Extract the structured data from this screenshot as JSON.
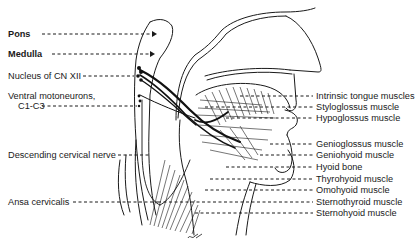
{
  "diagram": {
    "type": "anatomical-illustration",
    "signature": "ck",
    "left_labels": [
      {
        "text": "Pons",
        "bold": true
      },
      {
        "text": "Medulla",
        "bold": true
      },
      {
        "text": "Nucleus of CN XII",
        "bold": false
      },
      {
        "text": "Ventral motoneurons,",
        "bold": false
      },
      {
        "text": "C1-C3",
        "bold": false
      },
      {
        "text": "Descending cervical nerve",
        "bold": false
      },
      {
        "text": "Ansa cervicalis",
        "bold": false
      }
    ],
    "right_labels": [
      {
        "text": "Intrinsic tongue muscles"
      },
      {
        "text": "Styloglossus muscle"
      },
      {
        "text": "Hypoglossus muscle"
      },
      {
        "text": "Genioglossus muscle"
      },
      {
        "text": "Geniohyoid muscle"
      },
      {
        "text": "Hyoid bone"
      },
      {
        "text": "Thyrohyoid muscle"
      },
      {
        "text": "Omohyoid muscle"
      },
      {
        "text": "Sternothyroid muscle"
      },
      {
        "text": "Sternohyoid muscle"
      }
    ],
    "colors": {
      "ink": "#1a1a1a",
      "background": "#ffffff"
    }
  }
}
